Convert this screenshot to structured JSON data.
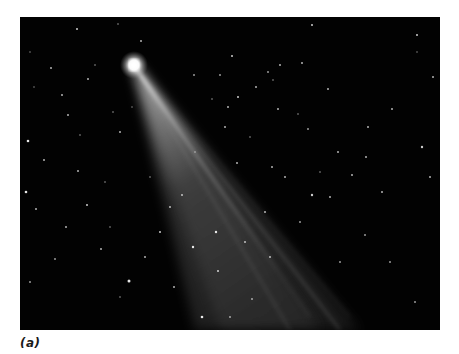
{
  "figure": {
    "caption": "(a)",
    "colors": {
      "sky": "#020202",
      "comet_head": "#ffffff",
      "tail": "#cfcfcf",
      "background": "#ffffff"
    }
  }
}
